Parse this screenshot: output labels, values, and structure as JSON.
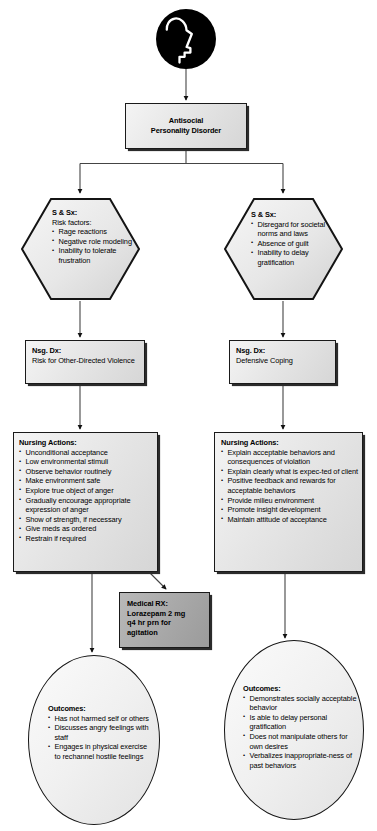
{
  "diagram": {
    "icon": {
      "name": "head-profile-icon"
    },
    "root": {
      "line1": "Antisocial",
      "line2": "Personality Disorder"
    },
    "columns": [
      {
        "id": "left",
        "signs": {
          "heading": "S & Sx:",
          "subheading": "Risk factors:",
          "items": [
            "Rage reactions",
            "Negative role modeling",
            "Inability to tolerate frustration"
          ]
        },
        "diagnosis": {
          "heading": "Nsg. Dx:",
          "text": "Risk for Other-Directed Violence"
        },
        "actions": {
          "heading": "Nursing Actions:",
          "items": [
            "Unconditional acceptance",
            "Low environmental stimuli",
            "Observe behavior routinely",
            "Make environment safe",
            "Explore true object of anger",
            "Gradually encourage appropriate expression of anger",
            "Show of strength, if necessary",
            "Give meds as ordered",
            "Restrain if required"
          ]
        },
        "outcomes": {
          "heading": "Outcomes:",
          "items": [
            "Has not harmed self or others",
            "Discusses angry feelings with staff",
            "Engages in physical exercise to rechannel hostile feelings"
          ]
        }
      },
      {
        "id": "right",
        "signs": {
          "heading": "S & Sx:",
          "subheading": "",
          "items": [
            "Disregard for societal norms and laws",
            "Absence of guilt",
            "Inability to delay gratification"
          ]
        },
        "diagnosis": {
          "heading": "Nsg. Dx:",
          "text": "Defensive Coping"
        },
        "actions": {
          "heading": "Nursing Actions:",
          "items": [
            "Explain acceptable behaviors and consequences of violation",
            "Explain clearly what is expec-ted of client",
            "Positive feedback and rewards for acceptable behaviors",
            "Provide milieu environment",
            "Promote insight development",
            "Maintain attitude of acceptance"
          ]
        },
        "outcomes": {
          "heading": "Outcomes:",
          "items": [
            "Demonstrates socially acceptable behavior",
            "Is able to delay personal gratification",
            "Does not manipulate others for own desires",
            "Verbalizes inappropriate-ness of past behaviors"
          ]
        }
      }
    ],
    "medication": {
      "heading": "Medical RX:",
      "lines": [
        "Lorazepam 2 mg",
        "q4 hr prn for",
        "agitation"
      ]
    },
    "colors": {
      "stroke": "#1a1a1a",
      "box_fill": "#ececec",
      "rx_fill": "#a9a9a9",
      "icon_fill": "#000000",
      "page_bg": "#ffffff"
    }
  }
}
